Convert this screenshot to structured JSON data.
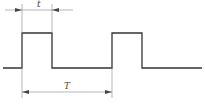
{
  "diagram": {
    "type": "pulse-waveform",
    "labels": {
      "pulse_width": "t",
      "period": "T"
    },
    "colors": {
      "waveform": "#333333",
      "dimension": "#777777"
    }
  }
}
